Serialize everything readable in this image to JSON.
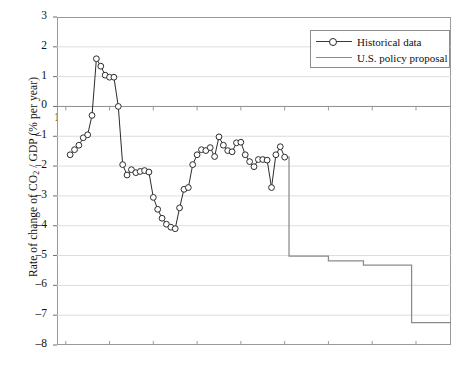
{
  "chart_data": {
    "type": "line",
    "title": "",
    "xlabel": "",
    "ylabel": "Rate of change of CO2 / GDP (% per year)",
    "ylabel_parts": {
      "pre": "Rate of change of CO",
      "sub": "2",
      "post": " / GDP (% per year)"
    },
    "xlim": [
      1958,
      2048
    ],
    "ylim": [
      -8,
      3
    ],
    "grid": "horizontal",
    "legend_position": "top-right",
    "xticks": [
      1960,
      1970,
      1980,
      1990,
      2000,
      2010,
      2020,
      2030,
      2040
    ],
    "xtick_labels": [
      "1960",
      "1970",
      "1980",
      "1990",
      "2000",
      "2010",
      "2020",
      "2030",
      "2040"
    ],
    "yticks": [
      3,
      2,
      1,
      0,
      -1,
      -2,
      -3,
      -4,
      -5,
      -6,
      -7,
      -8
    ],
    "ytick_labels": [
      "3",
      "2",
      "1",
      "0",
      "-1",
      "-2",
      "-3",
      "-4",
      "-5",
      "-6",
      "-7",
      "-8"
    ],
    "series": [
      {
        "name": "Historical data",
        "marker": "open-circle",
        "color": "#2b2b2b",
        "x": [
          1961,
          1962,
          1963,
          1964,
          1965,
          1966,
          1967,
          1968,
          1969,
          1970,
          1971,
          1972,
          1973,
          1974,
          1975,
          1976,
          1977,
          1978,
          1979,
          1980,
          1981,
          1982,
          1983,
          1984,
          1985,
          1986,
          1987,
          1988,
          1989,
          1990,
          1991,
          1992,
          1993,
          1994,
          1995,
          1996,
          1997,
          1998,
          1999,
          2000,
          2001,
          2002,
          2003,
          2004,
          2005,
          2006,
          2007,
          2008,
          2009,
          2010
        ],
        "values": [
          -1.62,
          -1.45,
          -1.3,
          -1.05,
          -0.95,
          -0.3,
          1.6,
          1.35,
          1.05,
          0.98,
          0.98,
          0.0,
          -1.95,
          -2.3,
          -2.12,
          -2.22,
          -2.18,
          -2.15,
          -2.2,
          -3.05,
          -3.45,
          -3.75,
          -3.95,
          -4.05,
          -4.1,
          -3.4,
          -2.78,
          -2.72,
          -1.95,
          -1.62,
          -1.45,
          -1.48,
          -1.38,
          -1.68,
          -1.02,
          -1.3,
          -1.48,
          -1.52,
          -1.22,
          -1.2,
          -1.62,
          -1.85,
          -2.02,
          -1.78,
          -1.78,
          -1.8,
          -2.72,
          -1.62,
          -1.35,
          -1.7
        ]
      },
      {
        "name": "U.S. policy proposal",
        "marker": "none",
        "color": "#8a8a8a",
        "step": true,
        "x": [
          2010,
          2011,
          2011,
          2020,
          2020,
          2028,
          2028,
          2039,
          2039,
          2048
        ],
        "values": [
          -1.7,
          -1.7,
          -5.02,
          -5.02,
          -5.18,
          -5.18,
          -5.32,
          -5.32,
          -7.25,
          -7.25
        ]
      }
    ]
  },
  "legend": {
    "items": [
      {
        "label": "Historical data",
        "style": "line-with-open-circle-marker"
      },
      {
        "label": "U.S. policy proposal",
        "style": "plain-grey-line"
      }
    ]
  }
}
